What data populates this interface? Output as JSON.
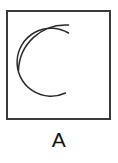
{
  "figure": {
    "caption": "A",
    "background_color": "#ffffff",
    "panel": {
      "name": "bounding-box",
      "shape": "rectangle",
      "fill_color": "#ffffff",
      "stroke_color": "#3a3a3a",
      "stroke_width": 1.2,
      "x": 7,
      "y": 11,
      "width": 103,
      "height": 108
    },
    "arcs": [
      {
        "name": "outer-arc",
        "shape": "circular-arc",
        "opening_direction": "right",
        "stroke_color": "#2b2b2b",
        "stroke_width": 1.5,
        "center_x": 72,
        "center_y": 59,
        "radius": 47,
        "start_angle_deg": 145,
        "end_angle_deg": 215,
        "start_point": [
          68,
          25
        ],
        "end_point": [
          18,
          70
        ],
        "path": "M 68.5 25.0 A 47 47 0 0 0 18.5 70.5"
      },
      {
        "name": "inner-arc",
        "shape": "circular-arc",
        "opening_direction": "right",
        "stroke_color": "#2b2b2b",
        "stroke_width": 1.5,
        "center_x": 72,
        "center_y": 61,
        "radius": 34,
        "start_angle_deg": 125,
        "end_angle_deg": 237,
        "start_point": [
          68,
          33
        ],
        "end_point": [
          65,
          93
        ],
        "path": "M 68.5 33.0 A 34 34 0 1 0 65.5 93.0"
      }
    ]
  }
}
